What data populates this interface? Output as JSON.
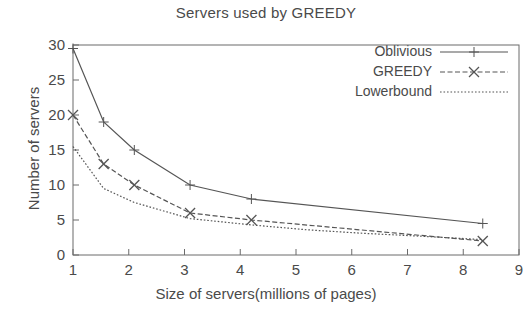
{
  "chart_data": {
    "type": "line",
    "title": "Servers used by GREEDY",
    "xlabel": "Size of servers(millions of pages)",
    "ylabel": "Number of servers",
    "xlim": [
      1,
      9
    ],
    "ylim": [
      0,
      30
    ],
    "xticks": [
      1,
      2,
      3,
      4,
      5,
      6,
      7,
      8,
      9
    ],
    "yticks": [
      0,
      5,
      10,
      15,
      20,
      25,
      30
    ],
    "grid": false,
    "legend_position": "top-right",
    "series": [
      {
        "name": "Oblivious",
        "marker": "plus",
        "linestyle": "solid",
        "color": "#555555",
        "x": [
          1.0,
          1.55,
          2.1,
          3.1,
          4.2,
          8.35
        ],
        "y": [
          29.5,
          19.0,
          15.0,
          10.0,
          8.0,
          4.5
        ]
      },
      {
        "name": "GREEDY",
        "marker": "cross",
        "linestyle": "dashed",
        "color": "#555555",
        "x": [
          1.0,
          1.55,
          2.1,
          3.1,
          4.2,
          8.35
        ],
        "y": [
          20.0,
          13.0,
          10.0,
          6.0,
          5.0,
          2.0
        ]
      },
      {
        "name": "Lowerbound",
        "marker": "none",
        "linestyle": "dotted",
        "color": "#555555",
        "x": [
          1.0,
          1.55,
          2.1,
          3.1,
          4.2,
          5.2,
          6.2,
          7.2,
          8.35
        ],
        "y": [
          15.5,
          9.5,
          7.5,
          5.2,
          4.3,
          3.6,
          3.1,
          2.7,
          2.2
        ]
      }
    ]
  },
  "legend": {
    "items": [
      {
        "label": "Oblivious"
      },
      {
        "label": "GREEDY"
      },
      {
        "label": "Lowerbound"
      }
    ]
  }
}
